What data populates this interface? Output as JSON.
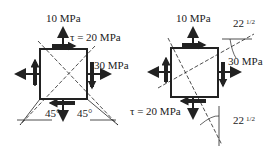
{
  "left_diagram": {
    "normal_y": "10 MPa",
    "shear": "τ = 20 MPa",
    "normal_x": "30 MPa",
    "angle_left": "45°",
    "angle_right": "45°"
  },
  "right_diagram": {
    "normal_y": "10 MPa",
    "shear": "τ = 20 MPa",
    "normal_x": "30 MPa",
    "angle_top": "22",
    "angle_top_frac": "1/2",
    "angle_bottom": "22",
    "angle_bottom_frac": "1/2"
  },
  "colors": {
    "ink": "#222222",
    "background": "#ffffff"
  }
}
